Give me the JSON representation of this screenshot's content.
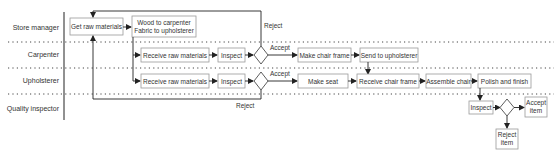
{
  "diagram": {
    "type": "swimlane-flowchart",
    "lanes": [
      {
        "id": "store",
        "label": "Store manager"
      },
      {
        "id": "carpenter",
        "label": "Carpenter"
      },
      {
        "id": "upholsterer",
        "label": "Upholsterer"
      },
      {
        "id": "qa",
        "label": "Quality inspector"
      }
    ],
    "nodes": {
      "get_raw": "Get raw materials",
      "wood_line1": "Wood to carpenter",
      "wood_line2": "Fabric to upholsterer",
      "c_receive": "Receive raw materials",
      "c_inspect": "Inspect",
      "c_make_frame": "Make chair frame",
      "c_send": "Send to upholsterer",
      "u_receive": "Receive raw materials",
      "u_inspect": "Inspect",
      "u_make_seat": "Make seat",
      "u_receive_frame": "Receive chair frame",
      "u_assemble": "Assemble chair",
      "u_polish": "Polish and finish",
      "q_inspect": "Inspect",
      "q_accept_line1": "Accept",
      "q_accept_line2": "item",
      "q_reject_line1": "Reject",
      "q_reject_line2": "item"
    },
    "edge_labels": {
      "c_reject": "Reject",
      "c_accept": "Accept",
      "u_accept": "Accept",
      "u_reject": "Reject"
    }
  }
}
